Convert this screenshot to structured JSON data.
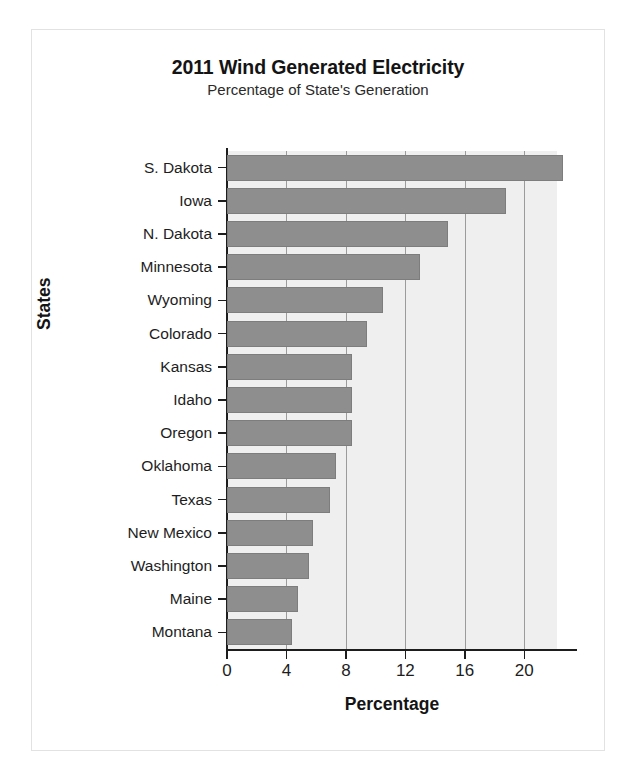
{
  "chart_data": {
    "type": "bar",
    "orientation": "horizontal",
    "title": "2011 Wind Generated Electricity",
    "subtitle": "Percentage of State's Generation",
    "xlabel": "Percentage",
    "ylabel": "States",
    "categories": [
      "S. Dakota",
      "Iowa",
      "N. Dakota",
      "Minnesota",
      "Wyoming",
      "Colorado",
      "Kansas",
      "Idaho",
      "Oregon",
      "Oklahoma",
      "Texas",
      "New Mexico",
      "Washington",
      "Maine",
      "Montana"
    ],
    "values": [
      22.6,
      18.8,
      14.9,
      13.0,
      10.5,
      9.4,
      8.4,
      8.4,
      8.4,
      7.3,
      6.9,
      5.8,
      5.5,
      4.8,
      4.4
    ],
    "xticks": [
      0,
      4,
      8,
      12,
      16,
      20
    ],
    "xlim": [
      0,
      22.2
    ],
    "grid": "vertical",
    "legend": "none",
    "bar_color": "#8e8e8e",
    "plot_background": "#efefef",
    "figure_background": "#ffffff",
    "axis_color": "#1d1d1d",
    "grid_color": "#9b9b9b"
  }
}
